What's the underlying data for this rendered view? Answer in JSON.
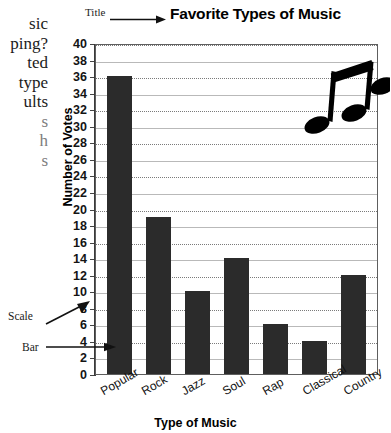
{
  "chart_data": {
    "type": "bar",
    "title": "Favorite Types of Music",
    "xlabel": "Type of Music",
    "ylabel": "Number of Votes",
    "categories": [
      "Popular",
      "Rock",
      "Jazz",
      "Soul",
      "Rap",
      "Classical",
      "Country"
    ],
    "values": [
      36,
      19,
      10,
      14,
      6,
      4,
      12
    ],
    "ylim": [
      0,
      40
    ],
    "ytick_step": 2,
    "yticks": [
      0,
      2,
      4,
      6,
      8,
      10,
      12,
      14,
      16,
      18,
      20,
      22,
      24,
      26,
      28,
      30,
      32,
      34,
      36,
      38,
      40
    ],
    "grid": "horizontal",
    "legend": "none",
    "bar_color": "#2b2b2b",
    "grid_color": "#b9b9b9"
  },
  "annotations": {
    "title_label": "Title",
    "scale_label": "Scale",
    "bar_label": "Bar"
  },
  "side_text": {
    "lines": [
      "sic",
      "ping?",
      "ted",
      "type",
      "ults",
      "s",
      "h",
      "s"
    ]
  },
  "decoration": {
    "music_note_icon": "eighth-note-pair"
  }
}
